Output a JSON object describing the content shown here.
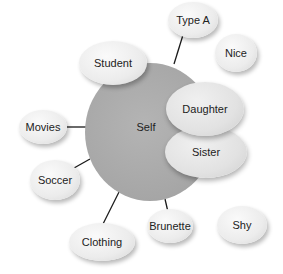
{
  "diagram": {
    "type": "self-concept bubble diagram",
    "center": {
      "label": "Self",
      "color": "#a8a8a8"
    },
    "overlapping_nodes": [
      {
        "label": "Daughter"
      },
      {
        "label": "Sister"
      }
    ],
    "connected_nodes": [
      {
        "label": "Type A"
      },
      {
        "label": "Student"
      },
      {
        "label": "Movies"
      },
      {
        "label": "Soccer"
      },
      {
        "label": "Clothing"
      },
      {
        "label": "Brunette"
      }
    ],
    "unconnected_nodes": [
      {
        "label": "Nice"
      },
      {
        "label": "Shy"
      }
    ],
    "colors": {
      "node_fill": "#ececec",
      "center_fill": "#a8a8a8",
      "connector": "#1a1a1a"
    }
  }
}
